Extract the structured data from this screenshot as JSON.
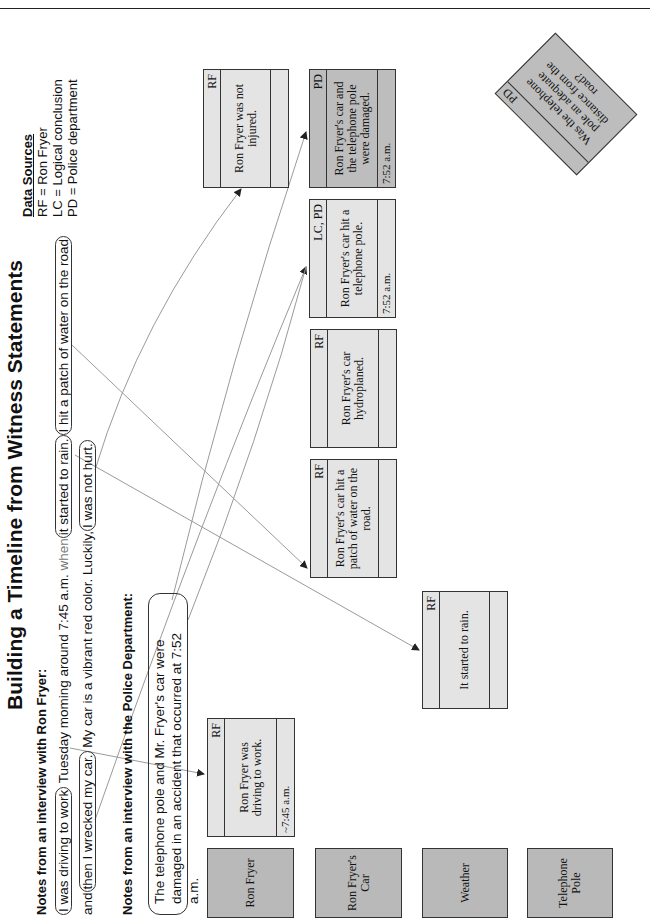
{
  "page_header": {
    "fragment": "Approach ... g"
  },
  "title": "Building a Timeline from Witness Statements",
  "ron_fryer_notes": {
    "heading": "Notes from an interview with Ron Fryer:",
    "line1": {
      "o1": "I was driving to work",
      "t1": " Tuesday moming around 7:45 a.m. ",
      "t2": "when",
      "o2": "it started to rain.",
      "o3": "I hit a patch of water on the road"
    },
    "line2": {
      "t1": "and",
      "o1": "then I wrecked my car.",
      "t2": " My car is a vibrant red color.  Luckily,",
      "o2": "I was not hurt."
    }
  },
  "police_notes": {
    "heading": "Notes from an interview with the Police Department:",
    "line1": "The telephone pole and Mr. Fryer's car were",
    "line2": "damaged in an accident that occurred at 7:52 a.m."
  },
  "legend": {
    "title": "Data Sources",
    "items": [
      "RF = Ron Fryer",
      "LC = Logical conclusion",
      "PD = Police department"
    ]
  },
  "categories": [
    "Ron Fryer",
    "Ron Fryer's Car",
    "Weather",
    "Telephone Pole"
  ],
  "cards": [
    {
      "source": "RF",
      "text": "Ron Fryer was driving to work.",
      "time": "~7:45 a.m."
    },
    {
      "source": "RF",
      "text": "It started to rain.",
      "time": ""
    },
    {
      "source": "RF",
      "text": "Ron Fryer's car hit a patch of water on the road.",
      "time": ""
    },
    {
      "source": "RF",
      "text": "Ron Fryer's car hydroplaned.",
      "time": ""
    },
    {
      "source": "LC, PD",
      "text": "Ron Fryer's car hit a telephone pole.",
      "time": "7:52 a.m."
    },
    {
      "source": "PD",
      "text": "Ron Fryer's car and the telephone pole were damaged.",
      "time": "7:52 a.m."
    },
    {
      "source": "RF",
      "text": "Ron Fryer was not injured.",
      "time": ""
    }
  ],
  "question_card": {
    "source": "PD",
    "text": "Was the telephone pole an adequate distance from the road?"
  },
  "colors": {
    "category_fill": "#b9b9b9",
    "card_fill": "#e4e4e4",
    "card_dark_fill": "#bdbdbd",
    "line": "#9a9a9a",
    "border": "#333333"
  }
}
